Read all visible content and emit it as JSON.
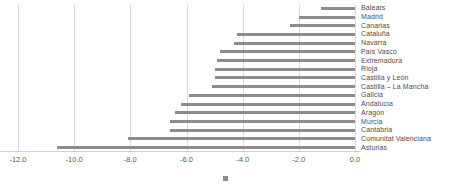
{
  "chart_data": {
    "type": "bar",
    "orientation": "horizontal",
    "title": "",
    "subtitle": "",
    "xlabel": "",
    "ylabel": "",
    "xlim": [
      -12.8,
      0.2
    ],
    "xticks": [
      -12.0,
      -10.0,
      -8.0,
      -6.0,
      -4.0,
      -2.0,
      0.0
    ],
    "xticklabels": [
      "-12.0",
      "-10.0",
      "-8.0",
      "-6.0",
      "-4.0",
      "-2.0",
      "0.0"
    ],
    "grid": "vertical",
    "legend_position": "bottom",
    "legend_marker": "square-marker",
    "legend_entries": [
      ""
    ],
    "bar_color": "#8c8c8c",
    "gridline_color": "#d9d9d9",
    "background_color": "#ffffff",
    "categories": [
      "Balears",
      "Madrid",
      "Canarias",
      "Cataluña",
      "Navarra",
      "País Vasco",
      "Extremadura",
      "Rioja",
      "Castilla y León",
      "Castilla – La Mancha",
      "Galicia",
      "Andalucía",
      "Aragón",
      "Murcia",
      "Cantabria",
      "Comunitat Valenciana",
      "Asturias"
    ],
    "values": [
      -1.2,
      -2.0,
      -2.3,
      -4.2,
      -4.3,
      -4.8,
      -4.9,
      -5.0,
      -5.0,
      -5.1,
      -5.9,
      -6.2,
      -6.4,
      -6.6,
      -6.6,
      -8.1,
      -10.6
    ]
  }
}
